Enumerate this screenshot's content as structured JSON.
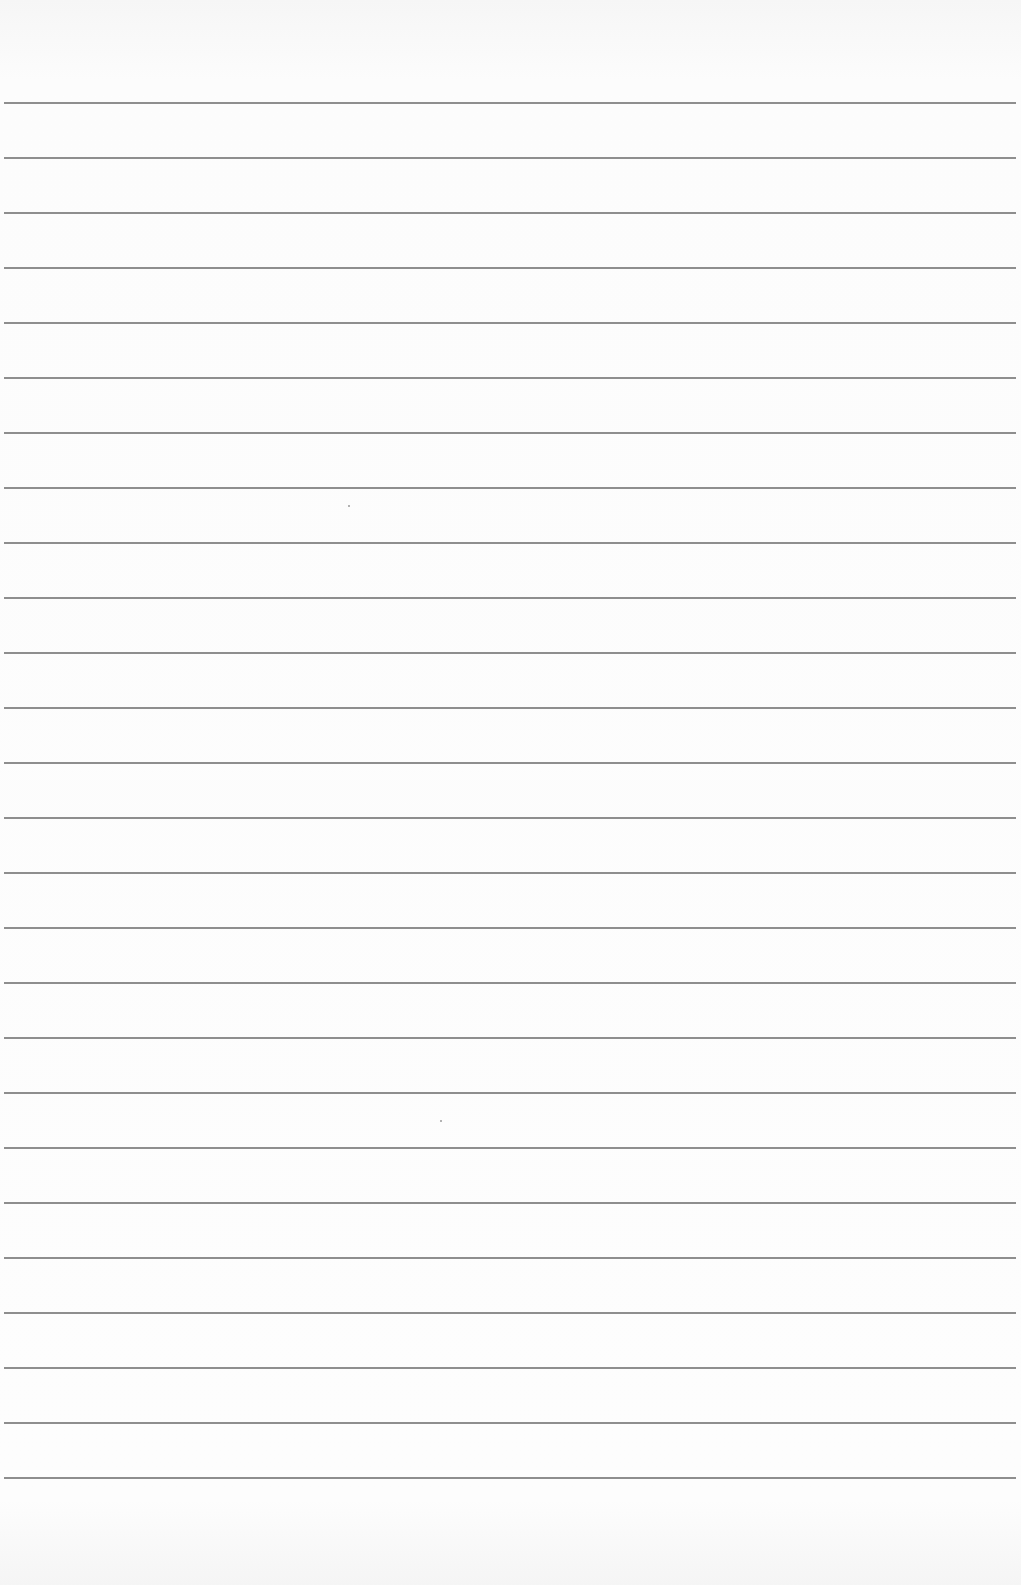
{
  "page": {
    "type": "lined-paper",
    "background_color": "#fbfbfb",
    "rule_color": "#8e8e8e",
    "rule_count": 26,
    "first_rule_y": 102,
    "rule_spacing": 55,
    "text": ""
  }
}
